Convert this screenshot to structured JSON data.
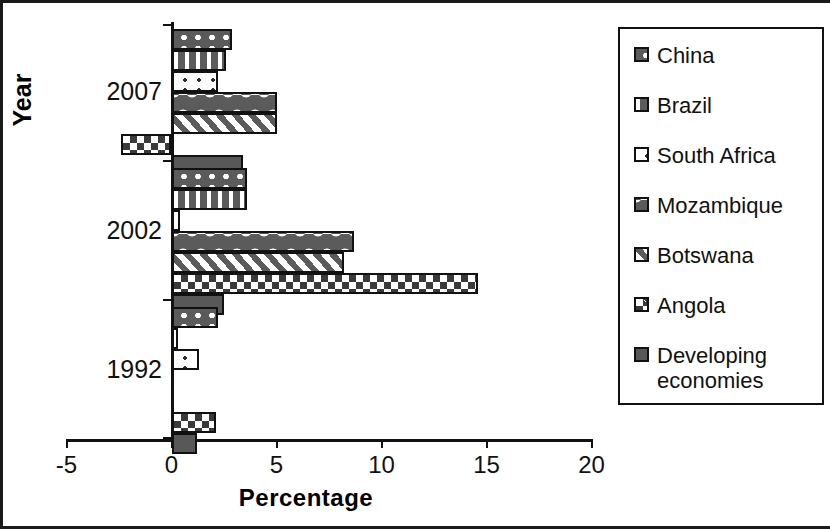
{
  "chart_data": {
    "type": "bar",
    "orientation": "horizontal",
    "title": "",
    "xlabel": "Percentage",
    "ylabel": "Year",
    "xlim": [
      -5,
      20
    ],
    "xticks": [
      "-5",
      "0",
      "5",
      "10",
      "15",
      "20"
    ],
    "categories": [
      "2007",
      "2002",
      "1992"
    ],
    "grid": false,
    "legend_position": "right",
    "series": [
      {
        "name": "China",
        "values": [
          2.9,
          3.6,
          2.2
        ]
      },
      {
        "name": "Brazil",
        "values": [
          2.6,
          3.6,
          0.3
        ]
      },
      {
        "name": "South Africa",
        "values": [
          2.2,
          0.4,
          1.3
        ]
      },
      {
        "name": "Mozambique",
        "values": [
          5.0,
          8.7,
          0.0
        ]
      },
      {
        "name": "Botswana",
        "values": [
          5.0,
          8.2,
          0.0
        ]
      },
      {
        "name": "Angola",
        "values": [
          -2.4,
          14.6,
          2.1
        ]
      },
      {
        "name": "Developing economies",
        "values": [
          3.4,
          2.5,
          1.2
        ]
      }
    ]
  },
  "axes": {
    "x_title": "Percentage",
    "y_title": "Year",
    "x_ticks": [
      {
        "label": "-5",
        "value": -5
      },
      {
        "label": "0",
        "value": 0
      },
      {
        "label": "5",
        "value": 5
      },
      {
        "label": "10",
        "value": 10
      },
      {
        "label": "15",
        "value": 15
      },
      {
        "label": "20",
        "value": 20
      }
    ],
    "y_groups": [
      {
        "label": "2007"
      },
      {
        "label": "2002"
      },
      {
        "label": "1992"
      }
    ]
  },
  "legend": {
    "items": [
      {
        "label": "China",
        "pattern": "large-white-dots"
      },
      {
        "label": "Brazil",
        "pattern": "vertical-bands"
      },
      {
        "label": "South Africa",
        "pattern": "small-dots-on-white"
      },
      {
        "label": "Mozambique",
        "pattern": "wave"
      },
      {
        "label": "Botswana",
        "pattern": "diagonal-stripes"
      },
      {
        "label": "Angola",
        "pattern": "checkerboard"
      },
      {
        "label": "Developing\neconomies",
        "pattern": "solid-gray"
      }
    ]
  }
}
